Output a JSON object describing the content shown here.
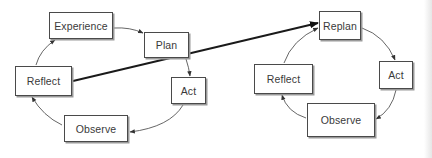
{
  "diagram": {
    "left_cycle": {
      "nodes": [
        {
          "id": "experience",
          "label": "Experience",
          "x": 49,
          "y": 12,
          "w": 64,
          "h": 27
        },
        {
          "id": "plan",
          "label": "Plan",
          "x": 144,
          "y": 32,
          "w": 45,
          "h": 26
        },
        {
          "id": "act",
          "label": "Act",
          "x": 171,
          "y": 77,
          "w": 35,
          "h": 27
        },
        {
          "id": "observe",
          "label": "Observe",
          "x": 64,
          "y": 115,
          "w": 64,
          "h": 27
        },
        {
          "id": "reflect",
          "label": "Reflect",
          "x": 15,
          "y": 66,
          "w": 57,
          "h": 30
        }
      ],
      "edges": [
        {
          "from": "experience",
          "to": "plan"
        },
        {
          "from": "plan",
          "to": "act"
        },
        {
          "from": "act",
          "to": "observe"
        },
        {
          "from": "observe",
          "to": "reflect"
        },
        {
          "from": "reflect",
          "to": "experience"
        }
      ]
    },
    "right_cycle": {
      "nodes": [
        {
          "id": "replan",
          "label": "Replan",
          "x": 319,
          "y": 11,
          "w": 42,
          "h": 29
        },
        {
          "id": "act",
          "label": "Act",
          "x": 379,
          "y": 61,
          "w": 34,
          "h": 28
        },
        {
          "id": "observe",
          "label": "Observe",
          "x": 307,
          "y": 103,
          "w": 68,
          "h": 34
        },
        {
          "id": "reflect",
          "label": "Reflect",
          "x": 254,
          "y": 64,
          "w": 59,
          "h": 30
        }
      ],
      "edges": [
        {
          "from": "replan",
          "to": "act"
        },
        {
          "from": "act",
          "to": "observe"
        },
        {
          "from": "observe",
          "to": "reflect"
        },
        {
          "from": "reflect",
          "to": "replan"
        }
      ]
    },
    "bridge_edge": {
      "from": "left_cycle.reflect",
      "to": "right_cycle.replan",
      "style": "bold"
    },
    "colors": {
      "box_border": "#4a4a4a",
      "box_shadow": "#9a9a9a",
      "text": "#3a3a3a",
      "arrow": "#555555",
      "bridge_arrow": "#1a1a1a",
      "background": "#ffffff"
    }
  }
}
